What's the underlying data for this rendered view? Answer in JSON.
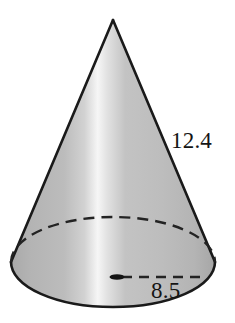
{
  "figure": {
    "type": "cone",
    "shape_name": "cone",
    "background_color": "#ffffff",
    "outline_color": "#1a1a1a",
    "fill_light": "#f4f4f4",
    "fill_mid": "#bdbdbd",
    "fill_dark": "#a8a8a8",
    "hidden_edge_style": "dashed",
    "labels": {
      "slant_height": "12.4",
      "radius": "8.5"
    },
    "geometry": {
      "apex_x": 113,
      "apex_y": 20,
      "base_center_x": 113,
      "base_center_y": 262,
      "base_radius_x": 102,
      "base_radius_y": 45,
      "center_dot_x": 117,
      "center_dot_y": 277
    }
  }
}
